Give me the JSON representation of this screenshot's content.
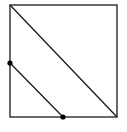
{
  "diagram": {
    "stroke_color": "#1a1a1a",
    "point_color": "#000000",
    "square": {
      "x1": 10,
      "y1": 5,
      "x2": 117,
      "y2": 117
    },
    "diagonal": {
      "x1": 10,
      "y1": 5,
      "x2": 117,
      "y2": 117
    },
    "segment": {
      "x1": 10,
      "y1": 63,
      "x2": 63,
      "y2": 117
    },
    "points": [
      {
        "name": "left-side-point",
        "x": 10,
        "y": 63
      },
      {
        "name": "bottom-side-point",
        "x": 63,
        "y": 117
      }
    ]
  }
}
